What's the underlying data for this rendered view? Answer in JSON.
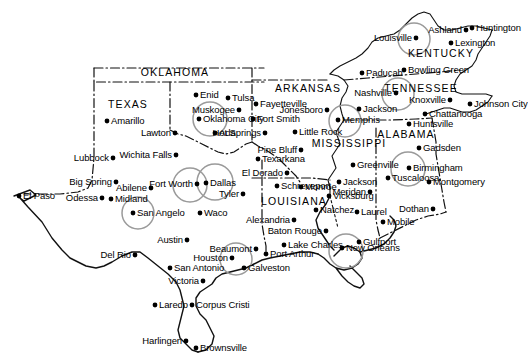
{
  "map": {
    "title": "Southern and Central United States City Map",
    "width": 528,
    "height": 364,
    "background_color": "#ffffff",
    "ink_color": "#111111",
    "highlight_color": "#9a9a9a",
    "highlight_note": "Gray circles mark selected metropolitan areas"
  },
  "states": [
    {
      "name": "OKLAHOMA",
      "x": 175,
      "y": 72
    },
    {
      "name": "TEXAS",
      "x": 128,
      "y": 104
    },
    {
      "name": "ARKANSAS",
      "x": 308,
      "y": 88
    },
    {
      "name": "MISSISSIPPI",
      "x": 349,
      "y": 143
    },
    {
      "name": "LOUISIANA",
      "x": 294,
      "y": 201
    },
    {
      "name": "ALABAMA",
      "x": 406,
      "y": 134
    },
    {
      "name": "TENNESSEE",
      "x": 421,
      "y": 88
    },
    {
      "name": "KENTUCKY",
      "x": 441,
      "y": 53
    }
  ],
  "cities": [
    {
      "name": "Enid",
      "dot_x": 196,
      "dot_y": 95,
      "label_side": "right",
      "highlighted": false
    },
    {
      "name": "Tulsa",
      "dot_x": 228,
      "dot_y": 98,
      "label_side": "right",
      "highlighted": false
    },
    {
      "name": "Muskogee",
      "dot_x": 239,
      "dot_y": 110,
      "label_side": "left",
      "highlighted": false
    },
    {
      "name": "Oklahoma City",
      "dot_x": 199,
      "dot_y": 119,
      "label_side": "right",
      "highlighted": true
    },
    {
      "name": "Ada",
      "dot_x": 215,
      "dot_y": 133,
      "label_side": "right",
      "highlighted": false
    },
    {
      "name": "Amarillo",
      "dot_x": 107,
      "dot_y": 121,
      "label_side": "right",
      "highlighted": false
    },
    {
      "name": "Lawton",
      "dot_x": 175,
      "dot_y": 133,
      "label_side": "left",
      "highlighted": false
    },
    {
      "name": "Lubbock",
      "dot_x": 113,
      "dot_y": 158,
      "label_side": "left",
      "highlighted": false
    },
    {
      "name": "Wichita Falls",
      "dot_x": 176,
      "dot_y": 155,
      "label_side": "left",
      "highlighted": false
    },
    {
      "name": "Big Spring",
      "dot_x": 116,
      "dot_y": 182,
      "label_side": "left",
      "highlighted": false
    },
    {
      "name": "Abilene",
      "dot_x": 151,
      "dot_y": 188,
      "label_side": "left",
      "highlighted": false
    },
    {
      "name": "Fort Worth",
      "dot_x": 197,
      "dot_y": 184,
      "label_side": "left",
      "highlighted": true
    },
    {
      "name": "Dallas",
      "dot_x": 206,
      "dot_y": 183,
      "label_side": "right",
      "highlighted": true
    },
    {
      "name": "El Paso",
      "dot_x": 19,
      "dot_y": 196,
      "label_side": "right",
      "highlighted": false
    },
    {
      "name": "Odessa",
      "dot_x": 102,
      "dot_y": 198,
      "label_side": "left",
      "highlighted": false
    },
    {
      "name": "Midland",
      "dot_x": 111,
      "dot_y": 199,
      "label_side": "right",
      "highlighted": false
    },
    {
      "name": "San Angelo",
      "dot_x": 133,
      "dot_y": 213,
      "label_side": "right",
      "highlighted": true
    },
    {
      "name": "Waco",
      "dot_x": 200,
      "dot_y": 213,
      "label_side": "right",
      "highlighted": false
    },
    {
      "name": "Tyler",
      "dot_x": 243,
      "dot_y": 194,
      "label_side": "left",
      "highlighted": false
    },
    {
      "name": "Austin",
      "dot_x": 187,
      "dot_y": 240,
      "label_side": "left",
      "highlighted": false
    },
    {
      "name": "Del Rio",
      "dot_x": 135,
      "dot_y": 255,
      "label_side": "left",
      "highlighted": false
    },
    {
      "name": "San Antonio",
      "dot_x": 170,
      "dot_y": 268,
      "label_side": "right",
      "highlighted": false
    },
    {
      "name": "Victoria",
      "dot_x": 203,
      "dot_y": 281,
      "label_side": "left",
      "highlighted": false
    },
    {
      "name": "Houston",
      "dot_x": 232,
      "dot_y": 258,
      "label_side": "left",
      "highlighted": true
    },
    {
      "name": "Beaumont",
      "dot_x": 256,
      "dot_y": 249,
      "label_side": "left",
      "highlighted": false
    },
    {
      "name": "Port Arthur",
      "dot_x": 266,
      "dot_y": 254,
      "label_side": "right",
      "highlighted": false
    },
    {
      "name": "Galveston",
      "dot_x": 244,
      "dot_y": 268,
      "label_side": "right",
      "highlighted": false
    },
    {
      "name": "Laredo",
      "dot_x": 155,
      "dot_y": 305,
      "label_side": "right",
      "highlighted": false
    },
    {
      "name": "Corpus Cristi",
      "dot_x": 192,
      "dot_y": 305,
      "label_side": "right",
      "highlighted": false
    },
    {
      "name": "Harlingen",
      "dot_x": 186,
      "dot_y": 341,
      "label_side": "left",
      "highlighted": false
    },
    {
      "name": "Brownsville",
      "dot_x": 196,
      "dot_y": 348,
      "label_side": "right",
      "highlighted": false
    },
    {
      "name": "Fayetteville",
      "dot_x": 256,
      "dot_y": 104,
      "label_side": "right",
      "highlighted": false
    },
    {
      "name": "Fort Smith",
      "dot_x": 253,
      "dot_y": 119,
      "label_side": "right",
      "highlighted": false
    },
    {
      "name": "Jonesboro",
      "dot_x": 327,
      "dot_y": 110,
      "label_side": "left",
      "highlighted": false
    },
    {
      "name": "Little Rock",
      "dot_x": 295,
      "dot_y": 132,
      "label_side": "right",
      "highlighted": false
    },
    {
      "name": "Hot Springs",
      "dot_x": 265,
      "dot_y": 133,
      "label_side": "left",
      "highlighted": false
    },
    {
      "name": "Pine Bluff",
      "dot_x": 301,
      "dot_y": 150,
      "label_side": "left",
      "highlighted": false
    },
    {
      "name": "Texarkana",
      "dot_x": 258,
      "dot_y": 159,
      "label_side": "right",
      "highlighted": false
    },
    {
      "name": "El Dorado",
      "dot_x": 287,
      "dot_y": 173,
      "label_side": "left",
      "highlighted": false
    },
    {
      "name": "Schreveport",
      "dot_x": 277,
      "dot_y": 186,
      "label_side": "right",
      "highlighted": false
    },
    {
      "name": "Monroe",
      "dot_x": 301,
      "dot_y": 187,
      "label_side": "right",
      "highlighted": false
    },
    {
      "name": "Alexandria",
      "dot_x": 294,
      "dot_y": 220,
      "label_side": "left",
      "highlighted": false
    },
    {
      "name": "Baton Rouge",
      "dot_x": 326,
      "dot_y": 231,
      "label_side": "left",
      "highlighted": false
    },
    {
      "name": "Lake Charles",
      "dot_x": 284,
      "dot_y": 245,
      "label_side": "right",
      "highlighted": false
    },
    {
      "name": "New Orleans",
      "dot_x": 342,
      "dot_y": 248,
      "label_side": "right",
      "highlighted": true
    },
    {
      "name": "Memphis",
      "dot_x": 338,
      "dot_y": 120,
      "label_side": "right",
      "highlighted": true
    },
    {
      "name": "Greenville",
      "dot_x": 353,
      "dot_y": 165,
      "label_side": "right",
      "highlighted": false
    },
    {
      "name": "Jackson",
      "dot_x": 339,
      "dot_y": 182,
      "label_side": "right",
      "highlighted": false
    },
    {
      "name": "Vicksburg",
      "dot_x": 329,
      "dot_y": 196,
      "label_side": "right",
      "highlighted": false
    },
    {
      "name": "Natchez",
      "dot_x": 316,
      "dot_y": 210,
      "label_side": "right",
      "highlighted": false
    },
    {
      "name": "Meridan",
      "dot_x": 370,
      "dot_y": 192,
      "label_side": "left",
      "highlighted": false
    },
    {
      "name": "Laurel",
      "dot_x": 357,
      "dot_y": 212,
      "label_side": "right",
      "highlighted": false
    },
    {
      "name": "Gulfport",
      "dot_x": 359,
      "dot_y": 242,
      "label_side": "right",
      "highlighted": false
    },
    {
      "name": "Mobile",
      "dot_x": 383,
      "dot_y": 222,
      "label_side": "right",
      "highlighted": false
    },
    {
      "name": "Paducah",
      "dot_x": 362,
      "dot_y": 73,
      "label_side": "right",
      "highlighted": false
    },
    {
      "name": "Bowling Green",
      "dot_x": 404,
      "dot_y": 70,
      "label_side": "right",
      "highlighted": false
    },
    {
      "name": "Louisville",
      "dot_x": 416,
      "dot_y": 38,
      "label_side": "left",
      "highlighted": true
    },
    {
      "name": "Lexington",
      "dot_x": 451,
      "dot_y": 43,
      "label_side": "right",
      "highlighted": false
    },
    {
      "name": "Ashland",
      "dot_x": 466,
      "dot_y": 30,
      "label_side": "left",
      "highlighted": false
    },
    {
      "name": "Huntington",
      "dot_x": 472,
      "dot_y": 28,
      "label_side": "right",
      "highlighted": false
    },
    {
      "name": "Nashville",
      "dot_x": 396,
      "dot_y": 93,
      "label_side": "left",
      "highlighted": true
    },
    {
      "name": "Jackson",
      "dot_x": 359,
      "dot_y": 109,
      "label_side": "right",
      "highlighted": false
    },
    {
      "name": "Knoxville",
      "dot_x": 450,
      "dot_y": 100,
      "label_side": "left",
      "highlighted": false
    },
    {
      "name": "Johnson City",
      "dot_x": 470,
      "dot_y": 104,
      "label_side": "right",
      "highlighted": false
    },
    {
      "name": "Chattanooga",
      "dot_x": 425,
      "dot_y": 114,
      "label_side": "right",
      "highlighted": false
    },
    {
      "name": "Huntsville",
      "dot_x": 409,
      "dot_y": 124,
      "label_side": "right",
      "highlighted": false
    },
    {
      "name": "Gadsden",
      "dot_x": 419,
      "dot_y": 148,
      "label_side": "right",
      "highlighted": false
    },
    {
      "name": "Birmingham",
      "dot_x": 409,
      "dot_y": 168,
      "label_side": "right",
      "highlighted": true
    },
    {
      "name": "Tuscaloosa",
      "dot_x": 388,
      "dot_y": 178,
      "label_side": "right",
      "highlighted": false
    },
    {
      "name": "Montgomery",
      "dot_x": 429,
      "dot_y": 182,
      "label_side": "right",
      "highlighted": false
    },
    {
      "name": "Dothan",
      "dot_x": 433,
      "dot_y": 209,
      "label_side": "left",
      "highlighted": false
    }
  ],
  "highlight_circles": [
    {
      "city": "Oklahoma City",
      "cx": 210,
      "cy": 119,
      "r": 17
    },
    {
      "city": "Fort Worth",
      "cx": 190,
      "cy": 185,
      "r": 17
    },
    {
      "city": "Dallas",
      "cx": 215,
      "cy": 182,
      "r": 18
    },
    {
      "city": "San Angelo",
      "cx": 138,
      "cy": 213,
      "r": 16
    },
    {
      "city": "Houston",
      "cx": 236,
      "cy": 259,
      "r": 16
    },
    {
      "city": "New Orleans",
      "cx": 346,
      "cy": 251,
      "r": 17
    },
    {
      "city": "Memphis",
      "cx": 345,
      "cy": 121,
      "r": 16
    },
    {
      "city": "Nashville",
      "cx": 398,
      "cy": 94,
      "r": 16
    },
    {
      "city": "Louisville",
      "cx": 414,
      "cy": 39,
      "r": 16
    },
    {
      "city": "Birmingham",
      "cx": 408,
      "cy": 169,
      "r": 17
    }
  ]
}
